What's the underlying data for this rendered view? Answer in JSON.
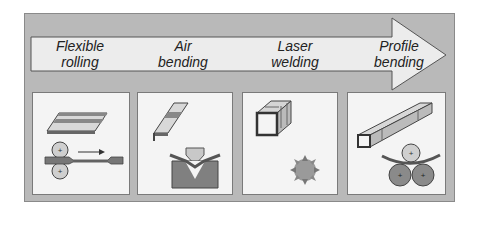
{
  "diagram": {
    "arrow": {
      "direction": "right",
      "fill": "#eeeeee",
      "stroke": "#555555"
    },
    "steps": [
      {
        "line1": "Flexible",
        "line2": "rolling",
        "illustration": "flexible-rolling-icon"
      },
      {
        "line1": "Air",
        "line2": "bending",
        "illustration": "air-bending-icon"
      },
      {
        "line1": "Laser",
        "line2": "welding",
        "illustration": "laser-welding-icon"
      },
      {
        "line1": "Profile",
        "line2": "bending",
        "illustration": "profile-bending-icon"
      }
    ],
    "colors": {
      "background": "#b9b9b9",
      "panel": "#f4f4f4",
      "dark_part": "#7d7d7d",
      "light_part": "#cfcfcf",
      "outline": "#444444"
    }
  }
}
